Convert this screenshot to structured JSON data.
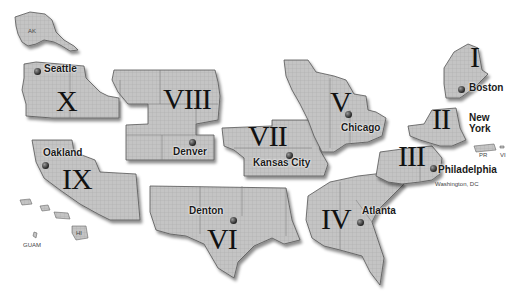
{
  "map": {
    "title": "Federal Regions Map",
    "colors": {
      "background": "#ffffff",
      "region_fill": "#bdbdbd",
      "outline": "#555555",
      "text": "#111111"
    },
    "regions": [
      {
        "numeral": "I",
        "city": "Boston"
      },
      {
        "numeral": "II",
        "city": "New York"
      },
      {
        "numeral": "III",
        "city": "Philadelphia"
      },
      {
        "numeral": "IV",
        "city": "Atlanta"
      },
      {
        "numeral": "V",
        "city": "Chicago"
      },
      {
        "numeral": "VI",
        "city": "Denton"
      },
      {
        "numeral": "VII",
        "city": "Kansas City"
      },
      {
        "numeral": "VIII",
        "city": "Denver"
      },
      {
        "numeral": "IX",
        "city": "Oakland"
      },
      {
        "numeral": "X",
        "city": "Seattle"
      }
    ],
    "city_labels": {
      "new_york_line1": "New",
      "new_york_line2": "York"
    },
    "territory_labels": {
      "alaska": "AK",
      "hawaii": "HI",
      "guam": "GUAM",
      "puerto_rico": "PR",
      "virgin_islands": "VI",
      "washington_dc": "Washington, DC"
    }
  }
}
